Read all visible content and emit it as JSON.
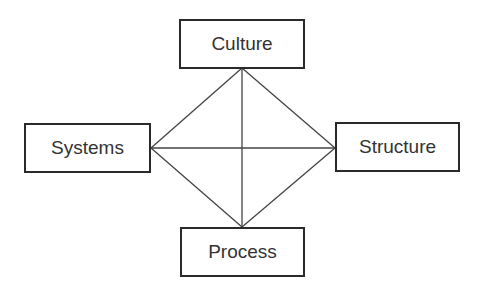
{
  "diagram": {
    "type": "four-node diamond with diagonals",
    "nodes": {
      "top": {
        "label": "Culture"
      },
      "left": {
        "label": "Systems"
      },
      "right": {
        "label": "Structure"
      },
      "bottom": {
        "label": "Process"
      }
    },
    "edges": [
      {
        "from": "Culture",
        "to": "Systems"
      },
      {
        "from": "Culture",
        "to": "Structure"
      },
      {
        "from": "Culture",
        "to": "Process"
      },
      {
        "from": "Systems",
        "to": "Structure"
      },
      {
        "from": "Systems",
        "to": "Process"
      },
      {
        "from": "Structure",
        "to": "Process"
      }
    ],
    "colors": {
      "line": "#444444",
      "border": "#2a2a2a",
      "text": "#333333",
      "background": "#ffffff"
    }
  }
}
